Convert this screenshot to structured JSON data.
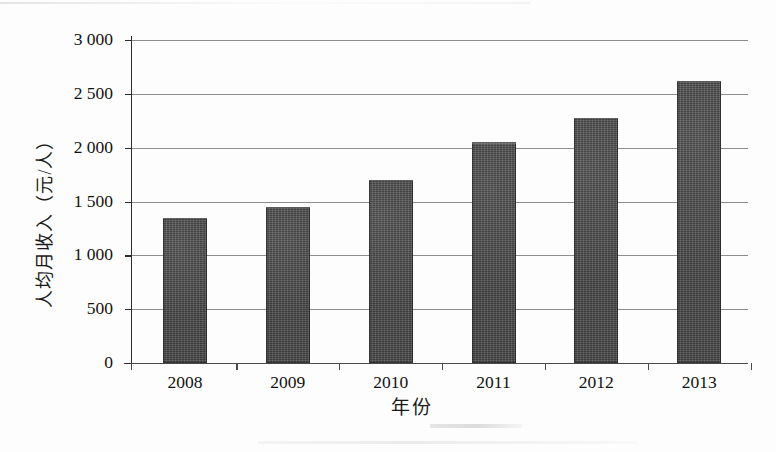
{
  "chart_data": {
    "type": "bar",
    "title": "",
    "xlabel": "年份",
    "ylabel": "人均月收入（元/人）",
    "categories": [
      "2008",
      "2009",
      "2010",
      "2011",
      "2012",
      "2013"
    ],
    "values": [
      1350,
      1450,
      1700,
      2050,
      2280,
      2620
    ],
    "ylim": [
      0,
      3000
    ],
    "ytick_labels": [
      "0",
      "500",
      "1 000",
      "1 500",
      "2 000",
      "2 500",
      "3 000"
    ],
    "ytick_values": [
      0,
      500,
      1000,
      1500,
      2000,
      2500,
      3000
    ],
    "grid": true,
    "legend": null,
    "series": [
      {
        "name": "人均月收入",
        "values": [
          1350,
          1450,
          1700,
          2050,
          2280,
          2620
        ]
      }
    ],
    "bar_color": "#3b3b3b",
    "axis_color": "#2b2b2b",
    "gridline_color": "#8d8d8d",
    "background_color": "#fdfdfd"
  }
}
